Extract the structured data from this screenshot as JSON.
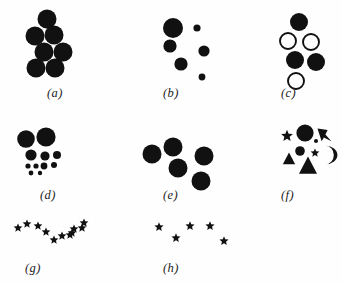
{
  "figure": {
    "background_color": "#fefefe",
    "ink_color": "#111111",
    "width": 342,
    "height": 284,
    "panel_count": 8
  },
  "panels": [
    {
      "id": "a",
      "label": "(a)",
      "label_x": 47,
      "label_y": 86,
      "description": "seven equal large filled circles in a compact hexagonal cluster",
      "shape_count": 7,
      "shapes": [
        {
          "kind": "circle",
          "fill": "solid",
          "cx": 47,
          "cy": 19,
          "r": 9.5
        },
        {
          "kind": "circle",
          "fill": "solid",
          "cx": 35,
          "cy": 36,
          "r": 9.5
        },
        {
          "kind": "circle",
          "fill": "solid",
          "cx": 54,
          "cy": 35,
          "r": 9.5
        },
        {
          "kind": "circle",
          "fill": "solid",
          "cx": 44,
          "cy": 52,
          "r": 9.5
        },
        {
          "kind": "circle",
          "fill": "solid",
          "cx": 63,
          "cy": 52,
          "r": 9.5
        },
        {
          "kind": "circle",
          "fill": "solid",
          "cx": 36,
          "cy": 68,
          "r": 9.5
        },
        {
          "kind": "circle",
          "fill": "solid",
          "cx": 55,
          "cy": 68,
          "r": 9.5
        }
      ]
    },
    {
      "id": "b",
      "label": "(b)",
      "label_x": 163,
      "label_y": 86,
      "description": "six filled circles of graded sizes, large at upper left to small at lower right",
      "shape_count": 6,
      "shapes": [
        {
          "kind": "circle",
          "fill": "solid",
          "cx": 173,
          "cy": 28,
          "r": 10.0
        },
        {
          "kind": "circle",
          "fill": "solid",
          "cx": 197,
          "cy": 28,
          "r": 3.6
        },
        {
          "kind": "circle",
          "fill": "solid",
          "cx": 170,
          "cy": 46,
          "r": 6.6
        },
        {
          "kind": "circle",
          "fill": "solid",
          "cx": 204,
          "cy": 51,
          "r": 5.6
        },
        {
          "kind": "circle",
          "fill": "solid",
          "cx": 181,
          "cy": 64,
          "r": 6.6
        },
        {
          "kind": "circle",
          "fill": "solid",
          "cx": 202,
          "cy": 77,
          "r": 3.4
        }
      ]
    },
    {
      "id": "c",
      "label": "(c)",
      "label_x": 281,
      "label_y": 86,
      "description": "three filled circles interleaved with three open outline circles",
      "shape_count": 6,
      "shapes": [
        {
          "kind": "circle",
          "fill": "solid",
          "cx": 299,
          "cy": 22,
          "r": 9.0
        },
        {
          "kind": "circle",
          "fill": "open",
          "cx": 288,
          "cy": 41,
          "r": 8.0
        },
        {
          "kind": "circle",
          "fill": "open",
          "cx": 311,
          "cy": 42,
          "r": 8.0
        },
        {
          "kind": "circle",
          "fill": "solid",
          "cx": 295,
          "cy": 60,
          "r": 9.0
        },
        {
          "kind": "circle",
          "fill": "solid",
          "cx": 316,
          "cy": 62,
          "r": 9.0
        },
        {
          "kind": "circle",
          "fill": "open",
          "cx": 296,
          "cy": 81,
          "r": 8.0
        }
      ]
    },
    {
      "id": "d",
      "label": "(d)",
      "label_x": 40,
      "label_y": 188,
      "description": "circles shrinking downward from two large at top to a scatter of tiny dots",
      "shape_count": 11,
      "shapes": [
        {
          "kind": "circle",
          "fill": "solid",
          "cx": 26,
          "cy": 139,
          "r": 8.8
        },
        {
          "kind": "circle",
          "fill": "solid",
          "cx": 46,
          "cy": 137,
          "r": 9.6
        },
        {
          "kind": "circle",
          "fill": "solid",
          "cx": 31,
          "cy": 155,
          "r": 5.6
        },
        {
          "kind": "circle",
          "fill": "solid",
          "cx": 45,
          "cy": 156,
          "r": 4.6
        },
        {
          "kind": "circle",
          "fill": "solid",
          "cx": 57,
          "cy": 155,
          "r": 4.0
        },
        {
          "kind": "circle",
          "fill": "solid",
          "cx": 28,
          "cy": 166,
          "r": 2.6
        },
        {
          "kind": "circle",
          "fill": "solid",
          "cx": 36,
          "cy": 166,
          "r": 2.6
        },
        {
          "kind": "circle",
          "fill": "solid",
          "cx": 44,
          "cy": 166,
          "r": 3.4
        },
        {
          "kind": "circle",
          "fill": "solid",
          "cx": 54,
          "cy": 165,
          "r": 3.0
        },
        {
          "kind": "circle",
          "fill": "solid",
          "cx": 31,
          "cy": 173,
          "r": 2.4
        },
        {
          "kind": "circle",
          "fill": "solid",
          "cx": 40,
          "cy": 173,
          "r": 2.2
        }
      ]
    },
    {
      "id": "e",
      "label": "(e)",
      "label_x": 163,
      "label_y": 188,
      "description": "five equal large filled circles loosely scattered",
      "shape_count": 5,
      "shapes": [
        {
          "kind": "circle",
          "fill": "solid",
          "cx": 173,
          "cy": 147,
          "r": 9.5
        },
        {
          "kind": "circle",
          "fill": "solid",
          "cx": 152,
          "cy": 154,
          "r": 9.5
        },
        {
          "kind": "circle",
          "fill": "solid",
          "cx": 204,
          "cy": 156,
          "r": 9.5
        },
        {
          "kind": "circle",
          "fill": "solid",
          "cx": 178,
          "cy": 168,
          "r": 9.5
        },
        {
          "kind": "circle",
          "fill": "solid",
          "cx": 201,
          "cy": 181,
          "r": 9.5
        }
      ]
    },
    {
      "id": "f",
      "label": "(f)",
      "label_x": 281,
      "label_y": 188,
      "description": "mixed shapes: circles, stars, triangles, a chevron and a crescent",
      "shape_count": 9,
      "shapes": [
        {
          "kind": "circle",
          "fill": "solid",
          "cx": 305,
          "cy": 133,
          "r": 8.6
        },
        {
          "kind": "star",
          "fill": "solid",
          "cx": 287,
          "cy": 136,
          "r": 6.2
        },
        {
          "kind": "chevron",
          "fill": "solid",
          "cx": 325,
          "cy": 134,
          "r": 7.5
        },
        {
          "kind": "circle",
          "fill": "solid",
          "cx": 300,
          "cy": 151,
          "r": 4.8
        },
        {
          "kind": "star",
          "fill": "solid",
          "cx": 315,
          "cy": 153,
          "r": 4.6
        },
        {
          "kind": "triangle",
          "fill": "solid",
          "cx": 289,
          "cy": 159,
          "r": 6.5
        },
        {
          "kind": "crescent",
          "fill": "solid",
          "cx": 327,
          "cy": 155,
          "r": 8.0
        },
        {
          "kind": "triangle",
          "fill": "solid",
          "cx": 308,
          "cy": 166,
          "r": 9.5
        },
        {
          "kind": "circle",
          "fill": "solid",
          "cx": 316,
          "cy": 141,
          "r": 2.0
        }
      ]
    },
    {
      "id": "g",
      "label": "(g)",
      "label_x": 25,
      "label_y": 261,
      "description": "eleven small stars arranged along a shallow V or chevron path",
      "shape_count": 11,
      "shapes": [
        {
          "kind": "star",
          "fill": "solid",
          "cx": 18,
          "cy": 228,
          "r": 4.6
        },
        {
          "kind": "star",
          "fill": "solid",
          "cx": 27,
          "cy": 224,
          "r": 4.6
        },
        {
          "kind": "star",
          "fill": "solid",
          "cx": 38,
          "cy": 226,
          "r": 4.6
        },
        {
          "kind": "star",
          "fill": "solid",
          "cx": 46,
          "cy": 232,
          "r": 4.6
        },
        {
          "kind": "star",
          "fill": "solid",
          "cx": 54,
          "cy": 240,
          "r": 4.6
        },
        {
          "kind": "star",
          "fill": "solid",
          "cx": 62,
          "cy": 236,
          "r": 4.6
        },
        {
          "kind": "star",
          "fill": "solid",
          "cx": 70,
          "cy": 235,
          "r": 4.6
        },
        {
          "kind": "star",
          "fill": "solid",
          "cx": 74,
          "cy": 229,
          "r": 4.6
        },
        {
          "kind": "star",
          "fill": "solid",
          "cx": 82,
          "cy": 228,
          "r": 4.6
        },
        {
          "kind": "star",
          "fill": "solid",
          "cx": 72,
          "cy": 233,
          "r": 4.6
        },
        {
          "kind": "star",
          "fill": "solid",
          "cx": 84,
          "cy": 223,
          "r": 4.6
        }
      ]
    },
    {
      "id": "h",
      "label": "(h)",
      "label_x": 163,
      "label_y": 261,
      "description": "six small stars loosely scattered with no clear path",
      "shape_count": 6,
      "shapes": [
        {
          "kind": "star",
          "fill": "solid",
          "cx": 159,
          "cy": 227,
          "r": 4.8
        },
        {
          "kind": "star",
          "fill": "solid",
          "cx": 190,
          "cy": 226,
          "r": 4.8
        },
        {
          "kind": "star",
          "fill": "solid",
          "cx": 210,
          "cy": 226,
          "r": 4.8
        },
        {
          "kind": "star",
          "fill": "solid",
          "cx": 176,
          "cy": 238,
          "r": 4.8
        },
        {
          "kind": "star",
          "fill": "solid",
          "cx": 224,
          "cy": 241,
          "r": 4.8
        }
      ]
    }
  ]
}
